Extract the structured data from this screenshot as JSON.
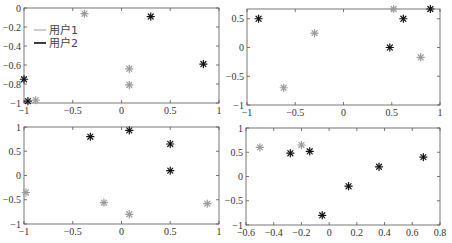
{
  "colors": {
    "user1": "#9a9a9a",
    "user2": "#111111",
    "axis": "#555555"
  },
  "legend": {
    "entries": [
      {
        "label": "用户1",
        "color": "#9a9a9a"
      },
      {
        "label": "用户2",
        "color": "#111111"
      }
    ]
  },
  "chart_data": [
    {
      "type": "scatter",
      "position": "top-left",
      "xlim": [
        -1,
        1
      ],
      "ylim": [
        -1,
        0
      ],
      "xticks": [
        -1,
        -0.5,
        0,
        0.5,
        1
      ],
      "yticks": [
        0,
        -0.2,
        -0.4,
        -0.6,
        -0.8,
        -1
      ],
      "xtick_labels": [
        "-1",
        "-0.5",
        "0",
        "0.5",
        "1"
      ],
      "ytick_labels": [
        "0",
        "-0.2",
        "-0.4",
        "-0.6",
        "-0.8",
        "-1"
      ],
      "legend": [
        "用户1",
        "用户2"
      ],
      "legend_position": "upper-left",
      "grid": false,
      "series": [
        {
          "name": "用户1",
          "marker": "*",
          "color": "#9a9a9a",
          "points": [
            [
              -0.38,
              -0.06
            ],
            [
              0.08,
              -0.64
            ],
            [
              0.08,
              -0.81
            ],
            [
              -0.88,
              -0.97
            ]
          ]
        },
        {
          "name": "用户2",
          "marker": "*",
          "color": "#111111",
          "points": [
            [
              0.3,
              -0.09
            ],
            [
              0.84,
              -0.59
            ],
            [
              -1.0,
              -0.75
            ],
            [
              -0.96,
              -0.98
            ]
          ]
        }
      ]
    },
    {
      "type": "scatter",
      "position": "top-right",
      "xlim": [
        -1,
        1
      ],
      "ylim": [
        -1,
        0.67
      ],
      "xticks": [
        -1,
        -0.5,
        0,
        0.5,
        1
      ],
      "yticks": [
        0.5,
        0,
        -0.5,
        -1
      ],
      "xtick_labels": [
        "-1",
        "-0.5",
        "0",
        "0.5",
        "1"
      ],
      "ytick_labels": [
        "0.5",
        "0",
        "-0.5",
        "-1"
      ],
      "grid": false,
      "series": [
        {
          "name": "用户1",
          "marker": "*",
          "color": "#9a9a9a",
          "points": [
            [
              -0.3,
              0.25
            ],
            [
              -0.62,
              -0.7
            ],
            [
              0.52,
              0.67
            ],
            [
              0.8,
              -0.17
            ]
          ]
        },
        {
          "name": "用户2",
          "marker": "*",
          "color": "#111111",
          "points": [
            [
              -0.88,
              0.5
            ],
            [
              0.48,
              0.0
            ],
            [
              0.62,
              0.5
            ],
            [
              0.9,
              0.67
            ]
          ]
        }
      ]
    },
    {
      "type": "scatter",
      "position": "bottom-left",
      "xlim": [
        -1,
        1
      ],
      "ylim": [
        -1,
        1
      ],
      "xticks": [
        -1,
        -0.5,
        0,
        0.5,
        1
      ],
      "yticks": [
        1,
        0.5,
        0,
        -0.5,
        -1
      ],
      "xtick_labels": [
        "-1",
        "-0.5",
        "0",
        "0.5",
        "1"
      ],
      "ytick_labels": [
        "1",
        "0.5",
        "0",
        "-0.5",
        "-1"
      ],
      "grid": false,
      "series": [
        {
          "name": "用户1",
          "marker": "*",
          "color": "#9a9a9a",
          "points": [
            [
              -0.98,
              -0.35
            ],
            [
              -0.18,
              -0.56
            ],
            [
              0.08,
              -0.8
            ],
            [
              0.88,
              -0.58
            ]
          ]
        },
        {
          "name": "用户2",
          "marker": "*",
          "color": "#111111",
          "points": [
            [
              -0.32,
              0.8
            ],
            [
              0.08,
              0.93
            ],
            [
              0.5,
              0.65
            ],
            [
              0.5,
              0.1
            ]
          ]
        }
      ]
    },
    {
      "type": "scatter",
      "position": "bottom-right",
      "xlim": [
        -0.6,
        0.8
      ],
      "ylim": [
        -1,
        1
      ],
      "xticks": [
        -0.6,
        -0.4,
        -0.2,
        0,
        0.2,
        0.4,
        0.6,
        0.8
      ],
      "yticks": [
        1,
        0.5,
        0,
        -0.5,
        -1
      ],
      "xtick_labels": [
        "-0.6",
        "-0.4",
        "-0.2",
        "0",
        "0.2",
        "0.4",
        "0.6",
        "0.8"
      ],
      "ytick_labels": [
        "1",
        "0.5",
        "0",
        "-0.5",
        "-1"
      ],
      "grid": false,
      "series": [
        {
          "name": "用户1",
          "marker": "*",
          "color": "#9a9a9a",
          "points": [
            [
              -0.5,
              0.6
            ],
            [
              -0.2,
              0.65
            ]
          ]
        },
        {
          "name": "用户2",
          "marker": "*",
          "color": "#111111",
          "points": [
            [
              -0.28,
              0.48
            ],
            [
              -0.14,
              0.52
            ],
            [
              -0.05,
              -0.8
            ],
            [
              0.14,
              -0.2
            ],
            [
              0.36,
              0.2
            ],
            [
              0.68,
              0.4
            ]
          ]
        }
      ]
    }
  ]
}
